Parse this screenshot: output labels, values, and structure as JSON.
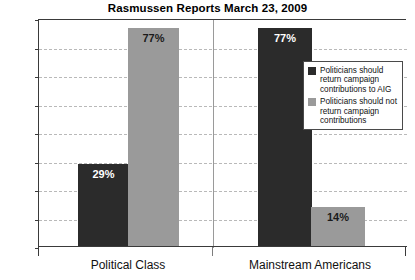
{
  "chart_data": {
    "type": "bar",
    "title": "Rasmussen Reports March 23, 2009",
    "xlabel": "",
    "ylabel": "",
    "categories": [
      "Political Class",
      "Mainstream Americans"
    ],
    "series": [
      {
        "name": "Politicians should return campaign contributions to AIG",
        "color": "#2b2b2b",
        "values": [
          29,
          77
        ],
        "labels": [
          "29%",
          "77%"
        ]
      },
      {
        "name": "Politicians should not return campaign contributions",
        "color": "#9a9a9a",
        "values": [
          77,
          14
        ],
        "labels": [
          "77%",
          "14%"
        ]
      }
    ],
    "ylim": [
      0,
      80
    ],
    "yticks": [
      0,
      10,
      20,
      30,
      40,
      50,
      60,
      70,
      80
    ],
    "ytick_labels": [
      "0%",
      "10%",
      "20%",
      "30%",
      "40%",
      "50%",
      "60%",
      "70%",
      "80%"
    ],
    "grid": true,
    "legend_position": "inside-right"
  },
  "legend": {
    "entries": [
      {
        "label": "Politicians should return campaign contributions to AIG",
        "color": "#2b2b2b"
      },
      {
        "label": "Politicians should not return campaign contributions",
        "color": "#9a9a9a"
      }
    ]
  }
}
